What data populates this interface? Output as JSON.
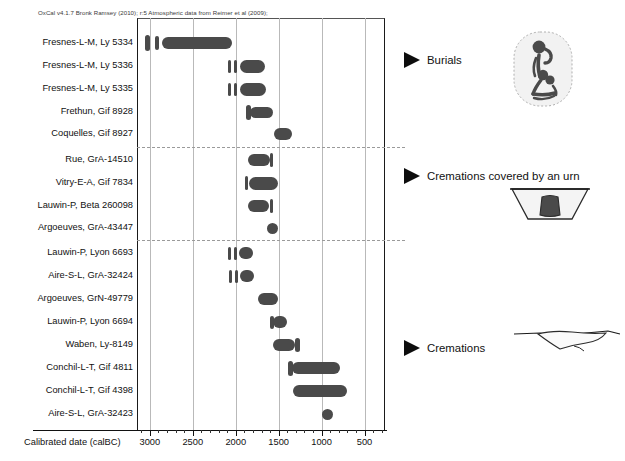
{
  "header": {
    "credit": "OxCal v4.1.7 Bronk Ramsey (2010); r:5 Atmospheric data from Reimer et al (2009);"
  },
  "axis": {
    "title": "Calibrated date (calBC)",
    "ticks": [
      3000,
      2500,
      2000,
      1500,
      1000,
      500
    ],
    "tick_labels": [
      "3000",
      "2500",
      "2000",
      "1500",
      "1000",
      "500"
    ]
  },
  "annotations": [
    {
      "label": "Burials",
      "icon": "crouched-skeleton-pictogram"
    },
    {
      "label": "Cremations covered by an urn",
      "icon": "urn-in-pit-pictogram"
    },
    {
      "label": "Cremations",
      "icon": "flat-pit-profile-pictogram"
    }
  ],
  "colors": {
    "distribution": "#4a4a4a",
    "gridline": "#b9b9b9",
    "frame": "#1a1a1a",
    "separator": "#9a9a9a",
    "text": "#111111"
  },
  "chart_data": {
    "type": "bar",
    "xlabel": "Calibrated date (calBC)",
    "ylabel": "",
    "xlim": [
      3150,
      250
    ],
    "x_reversed": true,
    "grid": true,
    "legend_position": "right",
    "x_ticks": [
      3000,
      2500,
      2000,
      1500,
      1000,
      500
    ],
    "categories": [
      "Fresnes-L-M, Ly 5334",
      "Fresnes-L-M, Ly 5336",
      "Fresnes-L-M, Ly 5335",
      "Frethun, Gif 8928",
      "Coquelles, Gif 8927",
      "Rue, GrA-14510",
      "Vitry-E-A, Gif 7834",
      "Lauwin-P, Beta 260098",
      "Argoeuves, GrA-43447",
      "Lauwin-P, Lyon 6693",
      "Aire-S-L, GrA-32424",
      "Argoeuves, GrN-49779",
      "Lauwin-P, Lyon 6694",
      "Waben, Ly-8149",
      "Conchil-L-T, Gif 4811",
      "Conchil-L-T, Gif 4398",
      "Aire-S-L, GrA-32423"
    ],
    "groups": [
      {
        "name": "Burials",
        "rows": [
          0,
          1,
          2,
          3,
          4
        ]
      },
      {
        "name": "Cremations covered by an urn",
        "rows": [
          5,
          6,
          7,
          8
        ]
      },
      {
        "name": "Cremations",
        "rows": [
          9,
          10,
          11,
          12,
          13,
          14,
          15,
          16
        ]
      }
    ],
    "series": [
      {
        "name": "Calibrated range (calBC)",
        "ranges": [
          {
            "label": "Fresnes-L-M, Ly 5334",
            "start": 2920,
            "end": 2010
          },
          {
            "label": "Fresnes-L-M, Ly 5336",
            "start": 1940,
            "end": 1600
          },
          {
            "label": "Fresnes-L-M, Ly 5335",
            "start": 1940,
            "end": 1590
          },
          {
            "label": "Frethun, Gif 8928",
            "start": 1760,
            "end": 1520
          },
          {
            "label": "Coquelles, Gif 8927",
            "start": 1440,
            "end": 1300
          },
          {
            "label": "Rue, GrA-14510",
            "start": 1690,
            "end": 1490
          },
          {
            "label": "Vitry-E-A, Gif 7834",
            "start": 1740,
            "end": 1450
          },
          {
            "label": "Lauwin-P, Beta 260098",
            "start": 1690,
            "end": 1490
          },
          {
            "label": "Argoeuves, GrA-43447",
            "start": 1420,
            "end": 1330
          },
          {
            "label": "Lauwin-P, Lyon 6693",
            "start": 2060,
            "end": 1880
          },
          {
            "label": "Aire-S-L, GrA-32424",
            "start": 2050,
            "end": 1870
          },
          {
            "label": "Argoeuves, GrN-49779",
            "start": 1570,
            "end": 1430
          },
          {
            "label": "Lauwin-P, Lyon 6694",
            "start": 1420,
            "end": 1290
          },
          {
            "label": "Waben, Ly-8149",
            "start": 1320,
            "end": 1160
          },
          {
            "label": "Conchil-L-T, Gif 4811",
            "start": 1240,
            "end": 830
          },
          {
            "label": "Conchil-L-T, Gif 4398",
            "start": 1180,
            "end": 790
          },
          {
            "label": "Aire-S-L, GrA-32423",
            "start": 800,
            "end": 720
          }
        ]
      }
    ]
  },
  "rows": [
    {
      "label": "Fresnes-L-M, Ly 5334",
      "y": 43,
      "spikes": [
        {
          "x": 145,
          "w": 5,
          "h": 16
        },
        {
          "x": 155,
          "w": 4,
          "h": 14
        }
      ],
      "bars": [
        {
          "x": 162,
          "w": 70,
          "h": 12
        }
      ]
    },
    {
      "label": "Fresnes-L-M, Ly 5336",
      "y": 66,
      "spikes": [
        {
          "x": 228,
          "w": 3,
          "h": 13
        },
        {
          "x": 234,
          "w": 3,
          "h": 13
        }
      ],
      "bars": [
        {
          "x": 240,
          "w": 25,
          "h": 13
        }
      ]
    },
    {
      "label": "Fresnes-L-M, Ly 5335",
      "y": 89,
      "spikes": [
        {
          "x": 228,
          "w": 3,
          "h": 13
        },
        {
          "x": 234,
          "w": 3,
          "h": 13
        }
      ],
      "bars": [
        {
          "x": 240,
          "w": 26,
          "h": 13
        }
      ]
    },
    {
      "label": "Frethun, Gif 8928",
      "y": 112,
      "spikes": [
        {
          "x": 246,
          "w": 5,
          "h": 15
        }
      ],
      "bars": [
        {
          "x": 250,
          "w": 23,
          "h": 11
        }
      ]
    },
    {
      "label": "Coquelles, Gif 8927",
      "y": 134,
      "spikes": [],
      "bars": [
        {
          "x": 274,
          "w": 18,
          "h": 12
        }
      ]
    },
    {
      "label": "Rue, GrA-14510",
      "y": 160,
      "spikes": [
        {
          "x": 270,
          "w": 3,
          "h": 14
        }
      ],
      "bars": [
        {
          "x": 248,
          "w": 22,
          "h": 12
        }
      ]
    },
    {
      "label": "Vitry-E-A, Gif 7834",
      "y": 183,
      "spikes": [
        {
          "x": 245,
          "w": 3,
          "h": 14
        }
      ],
      "bars": [
        {
          "x": 249,
          "w": 29,
          "h": 13
        }
      ]
    },
    {
      "label": "Lauwin-P, Beta 260098",
      "y": 206,
      "spikes": [
        {
          "x": 270,
          "w": 3,
          "h": 14
        }
      ],
      "bars": [
        {
          "x": 248,
          "w": 21,
          "h": 12
        }
      ]
    },
    {
      "label": "Argoeuves, GrA-43447",
      "y": 228,
      "spikes": [],
      "bars": [
        {
          "x": 267,
          "w": 11,
          "h": 11
        }
      ]
    },
    {
      "label": "Lauwin-P, Lyon 6693",
      "y": 253,
      "spikes": [
        {
          "x": 228,
          "w": 3,
          "h": 13
        },
        {
          "x": 234,
          "w": 3,
          "h": 13
        }
      ],
      "bars": [
        {
          "x": 239,
          "w": 14,
          "h": 12
        }
      ]
    },
    {
      "label": "Aire-S-L, GrA-32424",
      "y": 276,
      "spikes": [
        {
          "x": 229,
          "w": 3,
          "h": 13
        },
        {
          "x": 235,
          "w": 3,
          "h": 13
        }
      ],
      "bars": [
        {
          "x": 240,
          "w": 14,
          "h": 12
        }
      ]
    },
    {
      "label": "Argoeuves, GrN-49779",
      "y": 299,
      "spikes": [],
      "bars": [
        {
          "x": 258,
          "w": 20,
          "h": 12
        }
      ]
    },
    {
      "label": "Lauwin-P, Lyon 6694",
      "y": 322,
      "spikes": [
        {
          "x": 270,
          "w": 4,
          "h": 13
        }
      ],
      "bars": [
        {
          "x": 273,
          "w": 14,
          "h": 12
        }
      ]
    },
    {
      "label": "Waben, Ly-8149",
      "y": 345,
      "spikes": [
        {
          "x": 295,
          "w": 5,
          "h": 14
        }
      ],
      "bars": [
        {
          "x": 273,
          "w": 22,
          "h": 12
        }
      ]
    },
    {
      "label": "Conchil-L-T, Gif 4811",
      "y": 368,
      "spikes": [
        {
          "x": 288,
          "w": 5,
          "h": 15
        }
      ],
      "bars": [
        {
          "x": 292,
          "w": 48,
          "h": 12
        }
      ]
    },
    {
      "label": "Conchil-L-T, Gif 4398",
      "y": 391,
      "spikes": [],
      "bars": [
        {
          "x": 293,
          "w": 54,
          "h": 12
        }
      ]
    },
    {
      "label": "Aire-S-L, GrA-32423",
      "y": 414,
      "spikes": [],
      "bars": [
        {
          "x": 322,
          "w": 11,
          "h": 11
        }
      ]
    }
  ]
}
